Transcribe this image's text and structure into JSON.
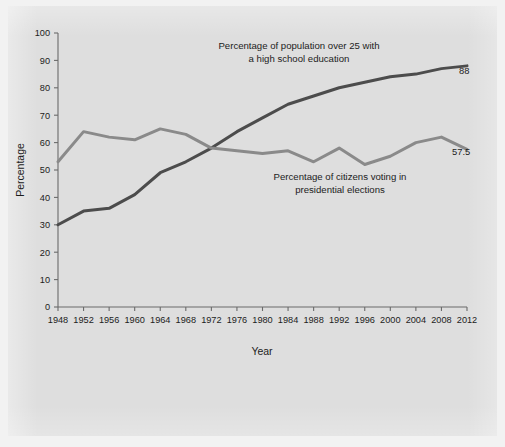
{
  "figure": {
    "background_color": "#dedede",
    "page_color": "#f2f2f2"
  },
  "axes": {
    "y_axis_title": "Percentage",
    "x_axis_title": "Year",
    "y_ticks": [
      "0",
      "10",
      "20",
      "30",
      "40",
      "50",
      "60",
      "70",
      "80",
      "90",
      "100"
    ],
    "x_ticks": [
      "1948",
      "1952",
      "1956",
      "1960",
      "1964",
      "1968",
      "1972",
      "1976",
      "1980",
      "1984",
      "1988",
      "1992",
      "1996",
      "2000",
      "2004",
      "2008",
      "2012"
    ]
  },
  "annotations": {
    "education_line1": "Percentage of population over 25 with",
    "education_line2": "a high school education",
    "voting_line1": "Percentage of citizens voting in",
    "voting_line2": "presidential elections",
    "education_end_value": "88",
    "voting_end_value": "57.5"
  },
  "chart_data": {
    "type": "line",
    "title": "",
    "xlabel": "Year",
    "ylabel": "Percentage",
    "xlim": [
      1948,
      2012
    ],
    "ylim": [
      0,
      100
    ],
    "grid": false,
    "legend": "inline annotations",
    "x": [
      1948,
      1952,
      1956,
      1960,
      1964,
      1968,
      1972,
      1976,
      1980,
      1984,
      1988,
      1992,
      1996,
      2000,
      2004,
      2008,
      2012
    ],
    "series": [
      {
        "name": "Percentage of population over 25 with a high school education",
        "color": "#4c4c4c",
        "stroke_width": 3.0,
        "end_label": "88",
        "values": [
          30,
          35,
          36,
          41,
          49,
          53,
          58,
          64,
          69,
          74,
          77,
          80,
          82,
          84,
          85,
          87,
          88
        ]
      },
      {
        "name": "Percentage of citizens voting in presidential elections",
        "color": "#8a8a8a",
        "stroke_width": 3.0,
        "end_label": "57.5",
        "values": [
          53,
          64,
          62,
          61,
          65,
          63,
          58,
          57,
          56,
          57,
          53,
          58,
          52,
          55,
          60,
          62,
          57.5
        ]
      }
    ]
  }
}
